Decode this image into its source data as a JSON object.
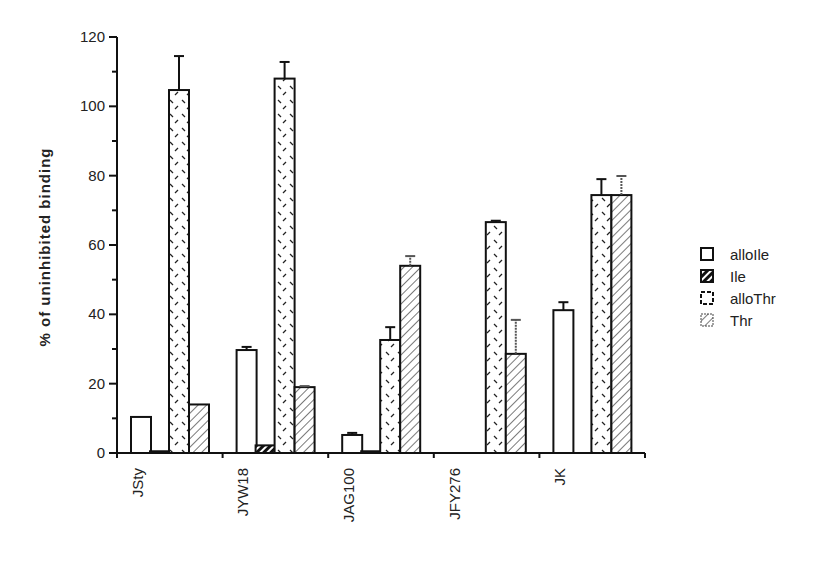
{
  "chart_data": {
    "type": "bar",
    "title": "",
    "xlabel": "",
    "ylabel": "% of uninhibited binding",
    "ylim": [
      0,
      120
    ],
    "yticks": [
      0,
      20,
      40,
      60,
      80,
      100,
      120
    ],
    "grid": false,
    "legend_position": "right",
    "categories": [
      "JSty",
      "JYW18",
      "JAG100",
      "JFY276",
      "JK"
    ],
    "series": [
      {
        "name": "alloIle",
        "pattern": "open",
        "values": [
          10.4,
          29.7,
          5.2,
          null,
          41.2
        ],
        "error_upper": [
          null,
          30.6,
          5.8,
          null,
          43.5
        ]
      },
      {
        "name": "Ile",
        "pattern": "dark-hatch",
        "values": [
          0.5,
          2.2,
          0.5,
          null,
          null
        ],
        "error_upper": [
          null,
          null,
          null,
          null,
          null
        ]
      },
      {
        "name": "alloThr",
        "pattern": "dashed-dots",
        "values": [
          104.7,
          108.0,
          32.6,
          66.6,
          74.4
        ],
        "error_upper": [
          114.5,
          112.8,
          36.3,
          67.0,
          79.0
        ]
      },
      {
        "name": "Thr",
        "pattern": "light-hatch",
        "values": [
          14.0,
          19.0,
          54.0,
          28.6,
          74.4
        ],
        "error_upper": [
          null,
          19.3,
          56.8,
          38.4,
          79.9
        ]
      }
    ]
  },
  "legend": {
    "items": [
      {
        "label": "alloIle"
      },
      {
        "label": "Ile"
      },
      {
        "label": "alloThr"
      },
      {
        "label": "Thr"
      }
    ]
  }
}
